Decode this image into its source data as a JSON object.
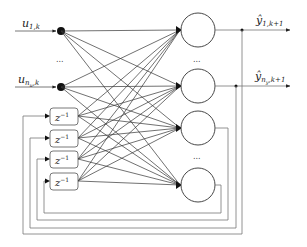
{
  "diagram": {
    "type": "recurrent-neural-network",
    "inputs": [
      {
        "symbol": "u",
        "subscript": "1,k"
      },
      {
        "symbol": "u",
        "subscript": "n",
        "subsub": "u",
        "subtail": ",k"
      }
    ],
    "input_ellipsis": "...",
    "outputs": [
      {
        "symbol": "ŷ",
        "subscript": "1,k+1"
      },
      {
        "symbol": "ŷ",
        "subscript": "n",
        "subsub": "y",
        "subtail": ",k+1"
      }
    ],
    "neuron_ellipsis_top": "...",
    "neuron_ellipsis_bottom": "...",
    "delay_blocks": [
      {
        "label": "z",
        "power": "−1"
      },
      {
        "label": "z",
        "power": "−1"
      },
      {
        "label": "z",
        "power": "−1"
      },
      {
        "label": "z",
        "power": "−1"
      }
    ],
    "neuron_count_shown": 4,
    "line_color": "#333333",
    "feedback_color": "#777777"
  }
}
